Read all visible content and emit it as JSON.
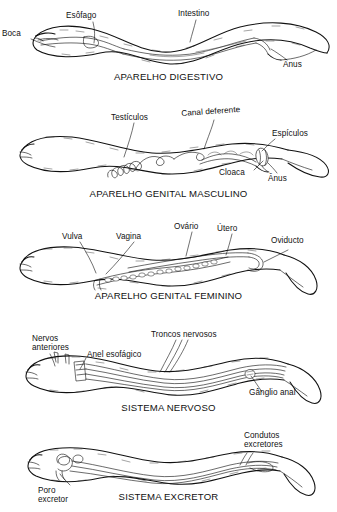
{
  "document": {
    "subject": "Nematode anatomy plates",
    "language": "pt-BR",
    "background_color": "#ffffff",
    "ink_color": "#111111"
  },
  "panels": [
    {
      "id": "digestive",
      "title": "APARELHO DIGESTIVO",
      "labels": [
        {
          "name": "boca",
          "text": "Boca"
        },
        {
          "name": "esofago",
          "text": "Esôfago"
        },
        {
          "name": "intestino",
          "text": "Intestino"
        },
        {
          "name": "anus",
          "text": "Ânus"
        }
      ]
    },
    {
      "id": "male-genital",
      "title": "APARELHO GENITAL MASCULINO",
      "labels": [
        {
          "name": "testiculos",
          "text": "Testículos"
        },
        {
          "name": "canal-deferente",
          "text": "Canal deferente"
        },
        {
          "name": "espiculos",
          "text": "Espículos"
        },
        {
          "name": "cloaca",
          "text": "Cloaca"
        },
        {
          "name": "anus",
          "text": "Ânus"
        }
      ]
    },
    {
      "id": "female-genital",
      "title": "APARELHO GENITAL FEMININO",
      "labels": [
        {
          "name": "vulva",
          "text": "Vulva"
        },
        {
          "name": "vagina",
          "text": "Vagina"
        },
        {
          "name": "ovario",
          "text": "Ovário"
        },
        {
          "name": "utero",
          "text": "Útero"
        },
        {
          "name": "oviducto",
          "text": "Oviducto"
        }
      ]
    },
    {
      "id": "nervous",
      "title": "SISTEMA NERVOSO",
      "labels": [
        {
          "name": "nervos-anteriores",
          "text": "Nervos\nanteriores"
        },
        {
          "name": "anel-esofagico",
          "text": "Anel esofágico"
        },
        {
          "name": "troncos-nervosos",
          "text": "Troncos nervosos"
        },
        {
          "name": "ganglio-anal",
          "text": "Gânglio anal"
        }
      ]
    },
    {
      "id": "excretory",
      "title": "SISTEMA EXCRETOR",
      "labels": [
        {
          "name": "condutos-excretores",
          "text": "Condutos\nexcretores"
        },
        {
          "name": "poro-excretor",
          "text": "Poro\nexcretor"
        }
      ]
    }
  ]
}
